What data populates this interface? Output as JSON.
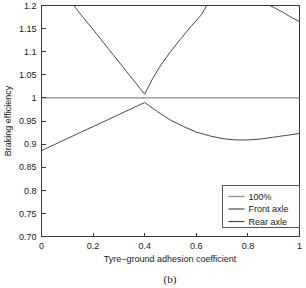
{
  "chart_data": {
    "type": "line",
    "title": "",
    "caption": "(b)",
    "xlabel": "Tyre−ground adhesion coefficient",
    "ylabel": "Braking efficiency",
    "xlim": [
      0,
      1
    ],
    "ylim": [
      0.7,
      1.2
    ],
    "grid": false,
    "legend_position": "lower-right",
    "xticks": [
      0,
      0.2,
      0.4,
      0.6,
      0.8,
      1
    ],
    "xticklabels": [
      "0",
      "0.2",
      "0.4",
      "0.6",
      "0.8",
      "1"
    ],
    "yticks": [
      0.7,
      0.75,
      0.8,
      0.85,
      0.9,
      0.95,
      1,
      1.05,
      1.1,
      1.15,
      1.2
    ],
    "yticklabels": [
      "0.70",
      "0.75",
      "0.8",
      "0.85",
      "0.9",
      "0.95",
      "1",
      "1.05",
      "1.1",
      "1.15",
      "1.2"
    ],
    "series": [
      {
        "name": "100%",
        "color": "#8a8a8a",
        "x": [
          0,
          1
        ],
        "values": [
          1.0,
          1.0
        ]
      },
      {
        "name": "Front axle",
        "color": "#4a4a4a",
        "x": [
          0.125,
          0.16,
          0.2,
          0.24,
          0.28,
          0.32,
          0.36,
          0.4,
          0.43,
          0.46,
          0.5,
          0.54,
          0.58,
          0.62,
          0.64,
          0.885,
          0.9,
          0.92,
          0.94,
          0.96,
          0.98,
          1.0
        ],
        "values": [
          1.2,
          1.175,
          1.148,
          1.12,
          1.092,
          1.064,
          1.036,
          1.008,
          1.041,
          1.069,
          1.1,
          1.128,
          1.155,
          1.18,
          1.2,
          1.2,
          1.196,
          1.19,
          1.184,
          1.177,
          1.171,
          1.165
        ]
      },
      {
        "name": "Rear axle",
        "color": "#4a4a4a",
        "x": [
          0,
          0.05,
          0.1,
          0.15,
          0.2,
          0.25,
          0.3,
          0.35,
          0.4,
          0.45,
          0.5,
          0.55,
          0.6,
          0.65,
          0.7,
          0.75,
          0.8,
          0.85,
          0.9,
          0.95,
          1.0
        ],
        "values": [
          0.886,
          0.899,
          0.912,
          0.925,
          0.938,
          0.951,
          0.964,
          0.977,
          0.99,
          0.97,
          0.952,
          0.938,
          0.926,
          0.918,
          0.912,
          0.909,
          0.909,
          0.911,
          0.915,
          0.919,
          0.923
        ]
      }
    ]
  },
  "legend": {
    "items": [
      {
        "label": "100%"
      },
      {
        "label": "Front axle"
      },
      {
        "label": "Rear axle"
      }
    ]
  }
}
